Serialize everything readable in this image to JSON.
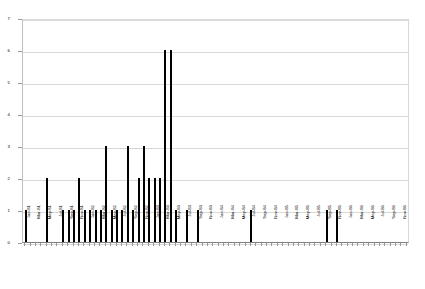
{
  "chart_data": {
    "type": "bar",
    "title": "",
    "subtitle": "",
    "xlabel": "",
    "ylabel": "",
    "ylim": [
      0,
      7
    ],
    "yticks": [
      0,
      1,
      2,
      3,
      4,
      5,
      6,
      7
    ],
    "ytick_labels": [
      "0",
      "1",
      "2",
      "3",
      "4",
      "5",
      "6",
      "7"
    ],
    "grid": true,
    "legend": false,
    "legend_position": "none",
    "bar_color": "#000000",
    "categories": [
      "Jan-81",
      "Feb-81",
      "Mar-81",
      "Apr-81",
      "May-81",
      "Jun-81",
      "Jul-81",
      "Aug-81",
      "Sep-81",
      "Oct-81",
      "Nov-81",
      "Dec-81",
      "Jan-82",
      "Feb-82",
      "Mar-82",
      "Apr-82",
      "May-82",
      "Jun-82",
      "Jul-82",
      "Aug-82",
      "Sep-82",
      "Oct-82",
      "Nov-82",
      "Dec-82",
      "Jan-83",
      "Feb-83",
      "Mar-83",
      "Apr-83",
      "May-83",
      "Jun-83",
      "Jul-83",
      "Aug-83",
      "Sep-83",
      "Oct-83",
      "Nov-83",
      "Dec-83",
      "Jan-84",
      "Feb-84",
      "Mar-84",
      "Apr-84",
      "May-84",
      "Jun-84",
      "Jul-84",
      "Aug-84",
      "Sep-84",
      "Oct-84",
      "Nov-84",
      "Dec-84",
      "Jan-85",
      "Feb-85",
      "Mar-85",
      "Apr-85",
      "May-85",
      "Jun-85",
      "Jul-85",
      "Aug-85",
      "Sep-85",
      "Oct-85",
      "Nov-85",
      "Dec-85",
      "Jan-86",
      "Feb-86",
      "Mar-86",
      "Apr-86",
      "May-86",
      "Jun-86",
      "Jul-86",
      "Aug-86",
      "Sep-86",
      "Oct-86",
      "Nov-86",
      "Dec-86"
    ],
    "tick_label_interval": 2,
    "values": [
      1,
      0,
      0,
      0,
      2,
      0,
      0,
      1,
      1,
      1,
      2,
      1,
      1,
      1,
      1,
      3,
      1,
      1,
      1,
      3,
      1,
      2,
      3,
      2,
      2,
      2,
      6,
      6,
      1,
      0,
      1,
      0,
      1,
      0,
      0,
      0,
      0,
      0,
      0,
      0,
      0,
      0,
      1,
      0,
      0,
      0,
      0,
      0,
      0,
      0,
      0,
      0,
      0,
      0,
      0,
      0,
      1,
      0,
      1,
      0,
      0,
      0,
      0,
      0,
      0,
      0,
      0,
      0,
      0,
      0,
      0,
      0
    ]
  }
}
